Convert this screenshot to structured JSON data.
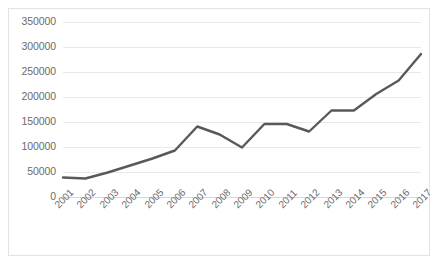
{
  "chart_data": {
    "type": "line",
    "title": "",
    "subtitle": "",
    "xlabel": "",
    "ylabel": "",
    "categories": [
      "2001",
      "2002",
      "2003",
      "2004",
      "2005",
      "2006",
      "2007",
      "2008",
      "2009",
      "2010",
      "2011",
      "2012",
      "2013",
      "2014",
      "2015",
      "2016",
      "2017"
    ],
    "series": [
      {
        "name": "Series 1",
        "color": "#595959",
        "values": [
          38000,
          36000,
          48000,
          62000,
          76000,
          92000,
          140000,
          124000,
          98000,
          145000,
          145000,
          130000,
          172000,
          172000,
          205000,
          232000,
          285000
        ]
      }
    ],
    "ylim": [
      0,
      350000
    ],
    "yticks": [
      0,
      50000,
      100000,
      150000,
      200000,
      250000,
      300000,
      350000
    ],
    "ytick_labels": [
      "0",
      "50000",
      "100000",
      "150000",
      "200000",
      "250000",
      "300000",
      "350000"
    ],
    "grid": true,
    "grid_axis": "y",
    "legend": false,
    "legend_position": "none",
    "markers": false,
    "annotations": []
  },
  "style": {
    "line_color": "#595959",
    "grid_color": "#e9e9e9",
    "axis_color": "#d8d8d8",
    "tick_text_color": "#6b6b6b",
    "border_color": "#e3e3e3",
    "background": "#ffffff"
  }
}
